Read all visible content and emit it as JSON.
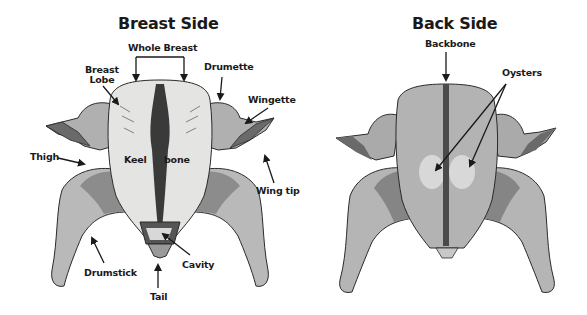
{
  "colors": {
    "background": "#ffffff",
    "skin_light": "#d6d6d6",
    "skin_breast": "#e4e4e2",
    "skin_mid": "#a9a9a9",
    "thigh_dark": "#8c8c8c",
    "keel_dark": "#3a3a3a",
    "backbone": "#4a4a4a",
    "oyster": "#e0e0e0",
    "wing_dark": "#6a6a6a",
    "outline": "#2a2a2a",
    "text": "#1a1a1a"
  },
  "panels": {
    "breast": {
      "title": "Breast Side",
      "labels": {
        "whole_breast": "Whole Breast",
        "breast_lobe_line1": "Breast",
        "breast_lobe_line2": "Lobe",
        "drumette": "Drumette",
        "wingette": "Wingette",
        "thigh": "Thigh",
        "keel": "Keel",
        "bone": "bone",
        "wing_tip": "Wing tip",
        "drumstick": "Drumstick",
        "cavity": "Cavity",
        "tail": "Tail"
      }
    },
    "back": {
      "title": "Back Side",
      "labels": {
        "backbone": "Backbone",
        "oysters": "Oysters"
      }
    }
  }
}
